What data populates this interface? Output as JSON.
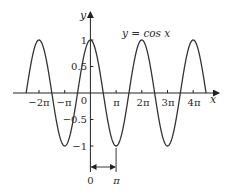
{
  "chart_data": {
    "type": "line",
    "title": "",
    "annotation": "y = cos x",
    "function": "cos",
    "xlabel": "x",
    "ylabel": "y",
    "x_range_of_curve": [
      -7.853981634,
      14.137166941
    ],
    "x_tick_labels": [
      "−2π",
      "−π",
      "0",
      "π",
      "2π",
      "3π",
      "4π"
    ],
    "x_tick_values": [
      -6.283185307,
      -3.141592654,
      0,
      3.141592654,
      6.283185307,
      9.424777961,
      12.566370614
    ],
    "y_tick_labels": [
      "1",
      "0.5",
      "−0.5",
      "−1"
    ],
    "y_tick_values": [
      1,
      0.5,
      -0.5,
      -1
    ],
    "ylim": [
      -1,
      1
    ],
    "grid": false,
    "period_annotation": {
      "start_label": "0",
      "end_label": "π",
      "description": "double-headed arrow from 0 to π"
    },
    "series": [
      {
        "name": "y = cos x",
        "x": [
          -7.854,
          -6.283,
          -4.712,
          -3.142,
          -1.571,
          0,
          1.571,
          3.142,
          4.712,
          6.283,
          7.854,
          9.425,
          10.996,
          12.566,
          14.137
        ],
        "values": [
          0,
          1,
          0,
          -1,
          0,
          1,
          0,
          -1,
          0,
          1,
          0,
          -1,
          0,
          1,
          0
        ]
      }
    ]
  },
  "labels": {
    "y_axis": "y",
    "x_axis": "x",
    "equation": "y = cos x",
    "xticks": [
      "−2π",
      "−π",
      "0",
      "π",
      "2π",
      "3π",
      "4π"
    ],
    "yticks": [
      "1",
      "0.5",
      "−0.5",
      "−1"
    ],
    "arrow_start": "0",
    "arrow_end": "π"
  },
  "colors": {
    "curve": "#333333",
    "axis": "#222222",
    "background": "#ffffff"
  }
}
